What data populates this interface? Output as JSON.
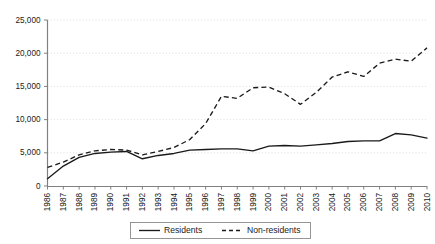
{
  "chart_data": {
    "type": "line",
    "title": "",
    "subtitle": "",
    "xlabel": "",
    "ylabel": "",
    "x": [
      1986,
      1987,
      1988,
      1989,
      1990,
      1991,
      1992,
      1993,
      1994,
      1995,
      1996,
      1997,
      1998,
      1999,
      2000,
      2001,
      2002,
      2003,
      2004,
      2005,
      2006,
      2007,
      2008,
      2009,
      2010
    ],
    "categories": [
      "1986",
      "1987",
      "1988",
      "1989",
      "1990",
      "1991",
      "1992",
      "1993",
      "1994",
      "1995",
      "1996",
      "1997",
      "1998",
      "1999",
      "2000",
      "2001",
      "2002",
      "2003",
      "2004",
      "2005",
      "2006",
      "2007",
      "2008",
      "2009",
      "2010"
    ],
    "series": [
      {
        "name": "Residents",
        "style": "solid",
        "color": "#1a1a1a",
        "values": [
          1100,
          3000,
          4300,
          4900,
          5100,
          5200,
          4100,
          4600,
          4900,
          5400,
          5500,
          5600,
          5600,
          5300,
          6000,
          6100,
          6000,
          6200,
          6400,
          6700,
          6800,
          6800,
          7900,
          7700,
          7200
        ]
      },
      {
        "name": "Non-residents",
        "style": "dashed",
        "color": "#1a1a1a",
        "values": [
          2800,
          3600,
          4700,
          5300,
          5500,
          5400,
          4700,
          5200,
          5800,
          7000,
          9400,
          13500,
          13200,
          14800,
          14900,
          13900,
          12300,
          14100,
          16400,
          17200,
          16500,
          18500,
          19100,
          18800,
          20800
        ]
      }
    ],
    "ylim": [
      0,
      25000
    ],
    "yticks": [
      0,
      5000,
      10000,
      15000,
      20000,
      25000
    ],
    "ytick_labels": [
      "0",
      "5,000",
      "10,000",
      "15,000",
      "20,000",
      "25,000"
    ],
    "grid": true,
    "grid_axis": "y",
    "legend": {
      "position": "bottom-center",
      "entries": [
        "Residents",
        "Non-residents"
      ]
    }
  },
  "legend": {
    "residents_label": "Residents",
    "nonresidents_label": "Non-residents"
  }
}
